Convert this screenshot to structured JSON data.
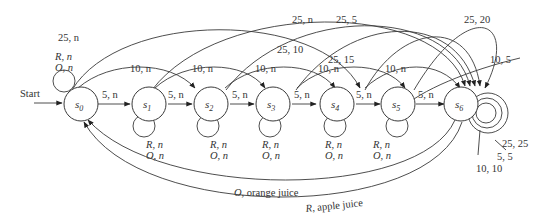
{
  "diagram": {
    "type": "finite-state-machine",
    "start_label": "Start",
    "states": [
      {
        "id": "s0",
        "label": "s",
        "sub": "0"
      },
      {
        "id": "s1",
        "label": "s",
        "sub": "1"
      },
      {
        "id": "s2",
        "label": "s",
        "sub": "2"
      },
      {
        "id": "s3",
        "label": "s",
        "sub": "3"
      },
      {
        "id": "s4",
        "label": "s",
        "sub": "4"
      },
      {
        "id": "s5",
        "label": "s",
        "sub": "5"
      },
      {
        "id": "s6",
        "label": "s",
        "sub": "6"
      }
    ],
    "self_loops": {
      "s0": [
        "R, n",
        "O, n"
      ],
      "s1": [
        "R, n",
        "O, n"
      ],
      "s2": [
        "R, n",
        "O, n"
      ],
      "s3": [
        "R, n",
        "O, n"
      ],
      "s4": [
        "R, n",
        "O, n"
      ],
      "s5": [
        "R, n",
        "O, n"
      ],
      "s6": [
        "25, 25",
        "5, 5",
        "10, 10"
      ]
    },
    "transitions": {
      "five": [
        {
          "from": "s0",
          "to": "s1",
          "label": "5, n"
        },
        {
          "from": "s1",
          "to": "s2",
          "label": "5, n"
        },
        {
          "from": "s2",
          "to": "s3",
          "label": "5, n"
        },
        {
          "from": "s3",
          "to": "s4",
          "label": "5, n"
        },
        {
          "from": "s4",
          "to": "s5",
          "label": "5, n"
        },
        {
          "from": "s5",
          "to": "s6",
          "label": "5, n"
        }
      ],
      "ten": [
        {
          "from": "s0",
          "to": "s2",
          "label": "10, n"
        },
        {
          "from": "s1",
          "to": "s3",
          "label": "10, n"
        },
        {
          "from": "s2",
          "to": "s4",
          "label": "10, n"
        },
        {
          "from": "s3",
          "to": "s5",
          "label": "10, n"
        },
        {
          "from": "s4",
          "to": "s6",
          "label": "10, n"
        },
        {
          "from": "s5",
          "to": "s6",
          "label": "10, 5"
        }
      ],
      "twentyfive": [
        {
          "from": "s0",
          "to": "s5",
          "label": "25, n"
        },
        {
          "from": "s1",
          "to": "s6",
          "label": "25, n"
        },
        {
          "from": "s2",
          "to": "s6",
          "label": "25, 5"
        },
        {
          "from": "s3",
          "to": "s6",
          "label": "25, 10"
        },
        {
          "from": "s4",
          "to": "s6",
          "label": "25, 15"
        },
        {
          "from": "s5",
          "to": "s6",
          "label": "25, 20"
        }
      ],
      "return": [
        {
          "from": "s6",
          "to": "s0",
          "label_var": "O",
          "label_rest": ", orange juice"
        },
        {
          "from": "s6",
          "to": "s0",
          "label_var": "R",
          "label_rest": ", apple juice"
        }
      ]
    }
  }
}
